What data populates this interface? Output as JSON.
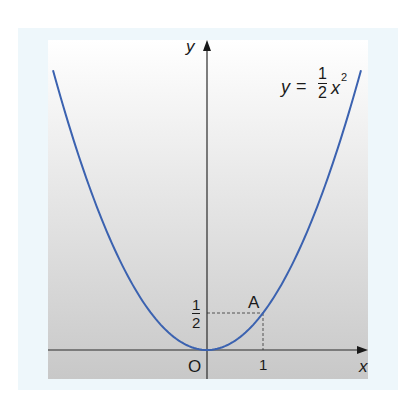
{
  "chart_data": {
    "type": "line",
    "title": "",
    "function": "y = 1/2 x^2",
    "equation_label": {
      "lhs": "y",
      "eq": "=",
      "num": "1",
      "den": "2",
      "var": "x",
      "exp": "2"
    },
    "xlabel": "x",
    "ylabel": "y",
    "origin_label": "O",
    "x_ticks": [
      {
        "value": 1,
        "label": "1"
      }
    ],
    "y_ticks": [
      {
        "value": 0.5,
        "label_num": "1",
        "label_den": "2"
      }
    ],
    "xlim": [
      -2.84,
      2.86
    ],
    "ylim": [
      -0.39,
      4.19
    ],
    "grid": false,
    "series": [
      {
        "name": "y = 1/2 x^2",
        "color": "#3b62b0",
        "x": [
          -2.75,
          -2.5,
          -2.0,
          -1.5,
          -1.0,
          -0.5,
          0,
          0.5,
          1.0,
          1.5,
          2.0,
          2.5,
          2.75
        ],
        "y": [
          3.78,
          3.125,
          2.0,
          1.125,
          0.5,
          0.125,
          0,
          0.125,
          0.5,
          1.125,
          2.0,
          3.125,
          3.78
        ]
      }
    ],
    "points": [
      {
        "label": "A",
        "x": 1,
        "y": 0.5
      }
    ],
    "guides": [
      {
        "from": [
          0,
          0.5
        ],
        "to": [
          1,
          0.5
        ],
        "style": "dashed"
      },
      {
        "from": [
          1,
          0
        ],
        "to": [
          1,
          0.5
        ],
        "style": "dashed"
      }
    ]
  },
  "labels": {
    "y_axis": "y",
    "x_axis": "x",
    "origin": "O",
    "x_tick_1": "1",
    "y_tick_num": "1",
    "y_tick_den": "2",
    "point_a": "A",
    "eq_lhs": "y",
    "eq_sign": "=",
    "eq_num": "1",
    "eq_den": "2",
    "eq_var": "x",
    "eq_exp": "2"
  },
  "colors": {
    "curve": "#3b62b0",
    "axis": "#2a2a2a",
    "panel_top": "#ffffff",
    "panel_bottom": "#c9c9c9",
    "border": "#eef7fb"
  }
}
